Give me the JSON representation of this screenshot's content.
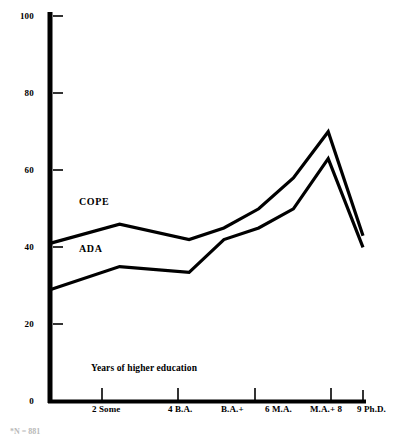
{
  "chart_data": {
    "type": "line",
    "title": "",
    "xlabel": "Years of higher education",
    "ylabel": "",
    "ylim": [
      0,
      100
    ],
    "yticks": [
      0,
      20,
      40,
      60,
      80,
      100
    ],
    "ytick_labels": [
      "0",
      "20",
      "40",
      "60",
      "80",
      "100"
    ],
    "grid": false,
    "legend": "inline-labels",
    "x": [
      0,
      2,
      4,
      5,
      6,
      7,
      8,
      9
    ],
    "xtick_positions": [
      2,
      4,
      6,
      8,
      9
    ],
    "xtick_labels": [
      "2  Some",
      "4  B.A.",
      "6  M.A.",
      "8",
      "9 Ph.D."
    ],
    "x_category_labels": [
      "2",
      "Some",
      "4",
      "B.A.",
      "B.A.+",
      "6",
      "M.A.",
      "M.A.+",
      "8",
      "9",
      "Ph.D."
    ],
    "series": [
      {
        "name": "COPE",
        "values": [
          41,
          46,
          42,
          45,
          50,
          58,
          70,
          43
        ]
      },
      {
        "name": "ADA",
        "values": [
          29,
          35,
          33.5,
          42,
          45,
          50,
          63,
          40
        ]
      }
    ]
  },
  "axis": {
    "y_labels": [
      "100",
      "80",
      "60",
      "40",
      "20",
      "0"
    ],
    "x_labels": [
      "2  Some",
      "4  B.A.",
      "B.A.+",
      "6  M.A.",
      "M.A.+  8",
      "9 Ph.D."
    ]
  },
  "labels": {
    "cope": "COPE",
    "ada": "ADA",
    "x_caption": "Years of higher education"
  },
  "footnote": {
    "text": "*N = 881"
  }
}
